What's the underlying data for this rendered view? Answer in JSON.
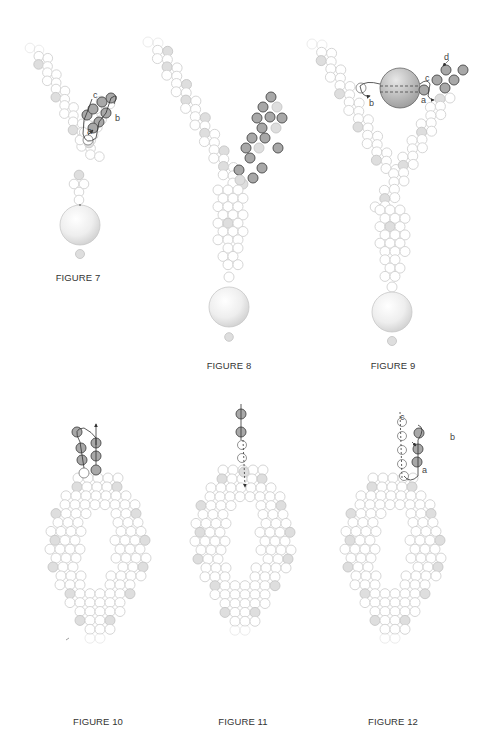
{
  "page": {
    "background": "#ffffff",
    "bead_colors": {
      "outline_light": "#d0d0d0",
      "fill_light": "#ffffff",
      "fill_accent": "#dedede",
      "outline_accent": "#c6c6c6",
      "fill_dark": "#a8a8a8",
      "outline_dark": "#555555",
      "thread": "#333333"
    }
  },
  "figures": [
    {
      "id": "figure-7",
      "caption": "FIGURE 7",
      "caption_pos": [
        78,
        272
      ],
      "labels": [
        {
          "text": "c",
          "x": 93,
          "y": 98
        },
        {
          "text": "b",
          "x": 115,
          "y": 121
        },
        {
          "text": "a",
          "x": 87,
          "y": 134
        }
      ]
    },
    {
      "id": "figure-8",
      "caption": "FIGURE 8",
      "caption_pos": [
        229,
        360
      ],
      "labels": []
    },
    {
      "id": "figure-9",
      "caption": "FIGURE 9",
      "caption_pos": [
        393,
        360
      ],
      "labels": [
        {
          "text": "d",
          "x": 444,
          "y": 60
        },
        {
          "text": "c",
          "x": 425,
          "y": 81
        },
        {
          "text": "b",
          "x": 369,
          "y": 106
        },
        {
          "text": "a",
          "x": 421,
          "y": 103
        }
      ]
    },
    {
      "id": "figure-10",
      "caption": "FIGURE 10",
      "caption_pos": [
        98,
        716
      ],
      "labels": []
    },
    {
      "id": "figure-11",
      "caption": "FIGURE 11",
      "caption_pos": [
        243,
        716
      ],
      "labels": []
    },
    {
      "id": "figure-12",
      "caption": "FIGURE 12",
      "caption_pos": [
        393,
        716
      ],
      "labels": [
        {
          "text": "c",
          "x": 400,
          "y": 420
        },
        {
          "text": "b",
          "x": 450,
          "y": 440
        },
        {
          "text": "a",
          "x": 422,
          "y": 473
        }
      ]
    }
  ]
}
